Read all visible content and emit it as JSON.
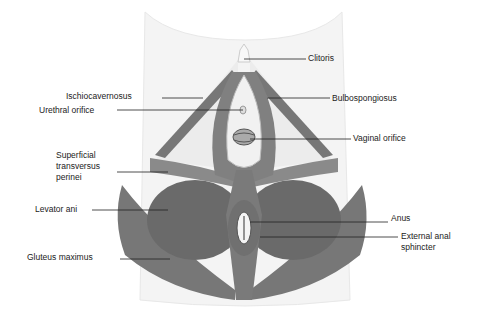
{
  "figure": {
    "type": "anatomical illustration",
    "colors": {
      "muscle": "#6e6e6e",
      "muscle_dark": "#4a4a4a",
      "skin": "#f2f2f2",
      "light_tissue": "#e6e6e6",
      "label_line": "#222222"
    }
  },
  "labels": {
    "clitoris": "Clitoris",
    "ischiocavernosus": "Ischiocavernosus",
    "bulbospongiosus": "Bulbospongiosus",
    "urethral_orifice": "Urethral orifice",
    "vaginal_orifice": "Vaginal orifice",
    "superficial_transversus_perinei_1": "Superficial",
    "superficial_transversus_perinei_2": "transversus",
    "superficial_transversus_perinei_3": "perinei",
    "levator_ani": "Levator ani",
    "anus": "Anus",
    "external_anal_sphincter_1": "External anal",
    "external_anal_sphincter_2": "sphincter",
    "gluteus_maximus": "Gluteus maximus"
  }
}
